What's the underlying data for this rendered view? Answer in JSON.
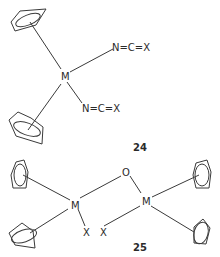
{
  "figure": {
    "structures": [
      {
        "id": "24",
        "label": "24",
        "metal": "M",
        "ligands": [
          {
            "type": "cyclopentadienyl",
            "position": "upper-left"
          },
          {
            "type": "cyclopentadienyl",
            "position": "lower-left"
          },
          {
            "type": "isocyanate",
            "text": "N=C=X",
            "position": "upper-right"
          },
          {
            "type": "isocyanate",
            "text": "N=C=X",
            "position": "lower-right"
          }
        ]
      },
      {
        "id": "25",
        "label": "25",
        "metals": [
          "M",
          "M"
        ],
        "bridge": "O",
        "terminal": [
          "X",
          "X"
        ],
        "ligands": [
          {
            "type": "cyclopentadienyl",
            "position": "left-upper"
          },
          {
            "type": "cyclopentadienyl",
            "position": "left-lower"
          },
          {
            "type": "cyclopentadienyl",
            "position": "right-upper"
          },
          {
            "type": "cyclopentadienyl",
            "position": "right-lower"
          }
        ]
      }
    ]
  },
  "atoms": {
    "s24_metal": "M",
    "s24_ncx_upper": "N=C=X",
    "s24_ncx_lower": "N=C=X",
    "s25_metal_left": "M",
    "s25_metal_right": "M",
    "s25_oxygen": "O",
    "s25_x_left": "X",
    "s25_x_right": "X"
  },
  "labels": {
    "compound_24": "24",
    "compound_25": "25"
  }
}
